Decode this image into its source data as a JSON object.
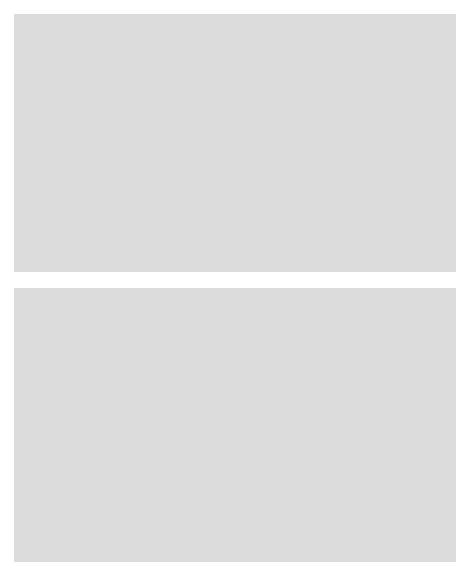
{
  "figure": {
    "background_color": "#ffffff",
    "panel_color": "#dcdcdc",
    "plot_background": "#ffffff",
    "point_color": "#4a4a52",
    "axis_color": "#262626"
  },
  "chart_data": [
    {
      "type": "scatter",
      "id": "top-scatter",
      "title": "",
      "xlabel": "x",
      "ylabel": "y",
      "xlim": [
        60,
        140
      ],
      "ylim": [
        40,
        160
      ],
      "xticks": [
        60,
        80,
        100,
        120,
        140
      ],
      "yticks": [
        40,
        60,
        80,
        100,
        120,
        140,
        160
      ],
      "xtick_labels": [
        "60",
        "80",
        "100",
        "120",
        "140"
      ],
      "ytick_labels": [
        "40",
        "60",
        "80",
        "100",
        "120",
        "140",
        "160"
      ],
      "grid": false,
      "legend": null,
      "n_points": 26,
      "points": [
        {
          "x": 65.4,
          "y": 52.5
        },
        {
          "x": 75.9,
          "y": 84.0
        },
        {
          "x": 75.3,
          "y": 60.5
        },
        {
          "x": 86.8,
          "y": 105.0
        },
        {
          "x": 86.4,
          "y": 81.0
        },
        {
          "x": 89.9,
          "y": 105.2
        },
        {
          "x": 90.0,
          "y": 87.0
        },
        {
          "x": 92.1,
          "y": 113.8
        },
        {
          "x": 92.8,
          "y": 129.5
        },
        {
          "x": 98.9,
          "y": 121.0
        },
        {
          "x": 100.6,
          "y": 102.2
        },
        {
          "x": 101.1,
          "y": 91.0
        },
        {
          "x": 102.9,
          "y": 130.2
        },
        {
          "x": 104.1,
          "y": 116.0
        },
        {
          "x": 106.2,
          "y": 88.8
        },
        {
          "x": 109.3,
          "y": 138.0
        },
        {
          "x": 109.9,
          "y": 117.8
        },
        {
          "x": 111.3,
          "y": 144.2
        },
        {
          "x": 111.6,
          "y": 97.0
        },
        {
          "x": 114.3,
          "y": 127.2
        },
        {
          "x": 115.0,
          "y": 153.0
        },
        {
          "x": 116.2,
          "y": 122.3
        },
        {
          "x": 124.2,
          "y": 112.0
        },
        {
          "x": 132.3,
          "y": 145.5
        },
        {
          "x": 136.4,
          "y": 117.0
        },
        {
          "x": 104.5,
          "y": 115.8
        }
      ]
    },
    {
      "type": "scatter",
      "id": "bottom-scatter",
      "title": "",
      "xlabel": "x",
      "ylabel": "y",
      "xlim": [
        0,
        250
      ],
      "ylim": [
        0,
        250
      ],
      "xticks": [
        0,
        50,
        100,
        150,
        200,
        250
      ],
      "yticks": [
        0,
        50,
        100,
        150,
        200,
        250
      ],
      "xtick_labels": [
        "0",
        "50",
        "100",
        "150",
        "200",
        "250"
      ],
      "ytick_labels": [
        "0",
        "50",
        "100",
        "150",
        "200",
        "250"
      ],
      "grid": false,
      "legend": null,
      "n_points": 26,
      "points": [
        {
          "x": 65.4,
          "y": 58.0
        },
        {
          "x": 75.9,
          "y": 67.5
        },
        {
          "x": 77.5,
          "y": 90.0
        },
        {
          "x": 86.8,
          "y": 107.5
        },
        {
          "x": 86.4,
          "y": 83.5
        },
        {
          "x": 89.9,
          "y": 106.0
        },
        {
          "x": 90.0,
          "y": 91.0
        },
        {
          "x": 92.1,
          "y": 115.5
        },
        {
          "x": 92.8,
          "y": 130.5
        },
        {
          "x": 95.5,
          "y": 123.5
        },
        {
          "x": 98.9,
          "y": 121.0
        },
        {
          "x": 100.6,
          "y": 107.0
        },
        {
          "x": 101.1,
          "y": 94.5
        },
        {
          "x": 100.0,
          "y": 131.0
        },
        {
          "x": 102.9,
          "y": 130.0
        },
        {
          "x": 104.1,
          "y": 119.5
        },
        {
          "x": 106.2,
          "y": 91.0
        },
        {
          "x": 105.5,
          "y": 101.5
        },
        {
          "x": 109.3,
          "y": 139.0
        },
        {
          "x": 109.9,
          "y": 121.5
        },
        {
          "x": 111.3,
          "y": 147.0
        },
        {
          "x": 112.5,
          "y": 155.5
        },
        {
          "x": 114.3,
          "y": 127.0
        },
        {
          "x": 113.0,
          "y": 133.0
        },
        {
          "x": 124.2,
          "y": 117.0
        },
        {
          "x": 132.3,
          "y": 148.5
        },
        {
          "x": 136.4,
          "y": 120.0
        }
      ]
    }
  ]
}
